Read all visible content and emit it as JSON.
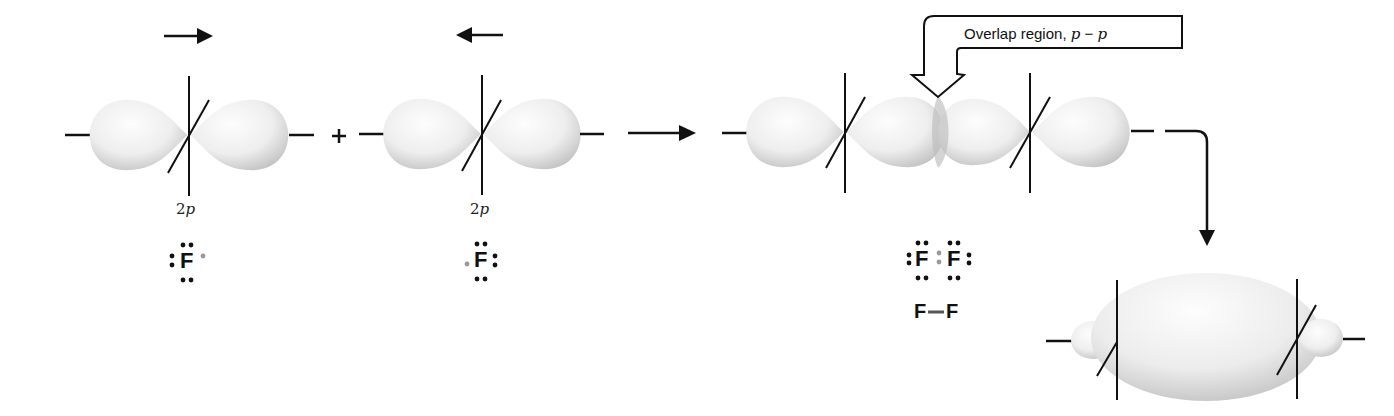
{
  "figure": {
    "colors": {
      "line": "#111111",
      "lobe_light": "#fbfbfb",
      "lobe_dark": "#c9c9c9",
      "unpaired_electron": "#888888"
    }
  },
  "atoms": [
    {
      "orbital_label": "2p",
      "symbol": "F",
      "approach_arrow": "right"
    },
    {
      "orbital_label": "2p",
      "symbol": "F",
      "approach_arrow": "left"
    }
  ],
  "operators": {
    "plus": "+"
  },
  "overlap": {
    "callout_prefix": "Overlap region, ",
    "callout_p1": "p",
    "callout_sep": " − ",
    "callout_p2": "p"
  },
  "molecule": {
    "lewis_left": "F",
    "lewis_right": "F",
    "bond_formula_left": "F",
    "bond_formula_right": "F"
  },
  "result": {
    "orbital_type": "sigma bonding orbital (p-p)"
  }
}
